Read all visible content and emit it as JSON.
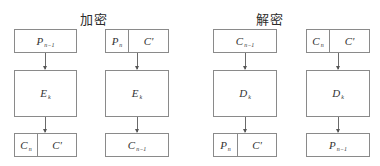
{
  "encryption": {
    "title": "加密",
    "columns": [
      {
        "top": {
          "cells": [
            {
              "base": "P",
              "sub": "n−1"
            }
          ]
        },
        "middle": {
          "base": "E",
          "sub": "k"
        },
        "bottom": {
          "cells": [
            {
              "base": "C",
              "sub": "n"
            },
            {
              "base": "C'",
              "sub": ""
            }
          ]
        }
      },
      {
        "top": {
          "cells": [
            {
              "base": "P",
              "sub": "n"
            },
            {
              "base": "C'",
              "sub": ""
            }
          ]
        },
        "middle": {
          "base": "E",
          "sub": "k"
        },
        "bottom": {
          "cells": [
            {
              "base": "C",
              "sub": "n−1"
            }
          ]
        }
      }
    ]
  },
  "decryption": {
    "title": "解密",
    "columns": [
      {
        "top": {
          "cells": [
            {
              "base": "C",
              "sub": "n−1"
            }
          ]
        },
        "middle": {
          "base": "D",
          "sub": "k"
        },
        "bottom": {
          "cells": [
            {
              "base": "P",
              "sub": "n"
            },
            {
              "base": "C'",
              "sub": ""
            }
          ]
        }
      },
      {
        "top": {
          "cells": [
            {
              "base": "C",
              "sub": "n"
            },
            {
              "base": "C'",
              "sub": ""
            }
          ]
        },
        "middle": {
          "base": "D",
          "sub": "k"
        },
        "bottom": {
          "cells": [
            {
              "base": "P",
              "sub": "n−1"
            }
          ]
        }
      }
    ]
  },
  "colors": {
    "border": "#8a8a8a",
    "arrow": "#6a6a6a",
    "text": "#333333"
  }
}
